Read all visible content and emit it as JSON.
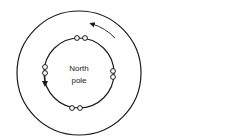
{
  "diagram": {
    "center_label_line1": "North",
    "center_label_line2": "pole",
    "stroke_color": "#1a1a1a",
    "background": "#ffffff",
    "outer_circle": {
      "cx": 79,
      "cy": 73,
      "r": 62
    },
    "inner_circle": {
      "cx": 79,
      "cy": 73,
      "r": 35
    },
    "beads": [
      {
        "cx": 77,
        "cy": 38
      },
      {
        "cx": 85,
        "cy": 38
      },
      {
        "cx": 45,
        "cy": 67
      },
      {
        "cx": 45,
        "cy": 73
      },
      {
        "cx": 113,
        "cy": 71
      },
      {
        "cx": 113,
        "cy": 77
      },
      {
        "cx": 72,
        "cy": 108
      },
      {
        "cx": 80,
        "cy": 108
      }
    ],
    "arrows": [
      "counterclockwise-outer-arrow",
      "counterclockwise-inner-arrow"
    ]
  }
}
